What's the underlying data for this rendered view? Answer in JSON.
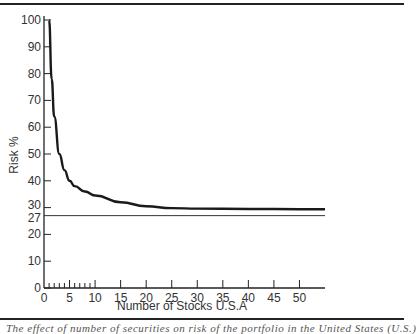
{
  "chart_data": {
    "type": "line",
    "title": "",
    "xlabel": "Number of Stocks U.S.A",
    "ylabel": "Risk %",
    "xlim": [
      0,
      55
    ],
    "ylim": [
      0,
      100
    ],
    "x_ticks": [
      0,
      5,
      10,
      15,
      20,
      25,
      30,
      35,
      40,
      45,
      50
    ],
    "x_minor_ticks": [
      1,
      2,
      3,
      4,
      6,
      7,
      8,
      9
    ],
    "y_ticks": [
      0,
      10,
      20,
      27,
      30,
      40,
      50,
      60,
      70,
      80,
      90,
      100
    ],
    "grid": false,
    "legend": null,
    "series": [
      {
        "name": "Portfolio risk",
        "x": [
          1,
          1.5,
          2,
          3,
          4,
          5,
          6,
          8,
          10,
          15,
          20,
          25,
          30,
          40,
          50,
          55
        ],
        "y": [
          100,
          78,
          64,
          50,
          44,
          40,
          38,
          36,
          34.5,
          32,
          30.5,
          29.8,
          29.6,
          29.5,
          29.4,
          29.4
        ]
      },
      {
        "name": "Systematic (market) risk floor",
        "x": [
          0,
          55
        ],
        "y": [
          27,
          27
        ]
      }
    ],
    "annotations": [
      {
        "text": "27",
        "at": {
          "axis": "y",
          "value": 27
        }
      }
    ]
  },
  "labels": {
    "xlabel": "Number of Stocks U.S.A",
    "ylabel": "Risk %",
    "caption_fragment": "The effect of number of securities on risk of the portfolio in the United States (U.S.)"
  }
}
